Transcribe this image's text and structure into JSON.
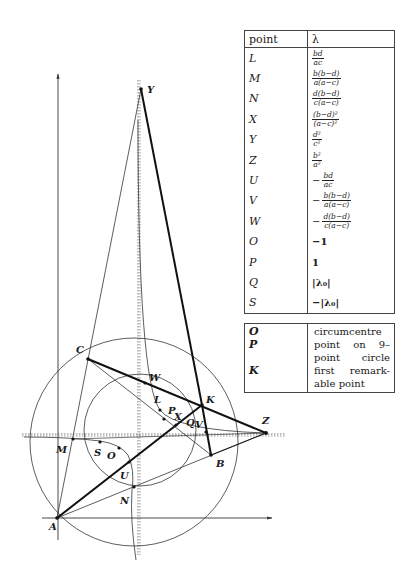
{
  "diagram": {
    "points": [
      {
        "name": "Y",
        "label": "Y"
      },
      {
        "name": "C",
        "label": "C"
      },
      {
        "name": "W",
        "label": "W"
      },
      {
        "name": "L",
        "label": "L"
      },
      {
        "name": "K",
        "label": "K"
      },
      {
        "name": "P",
        "label": "P"
      },
      {
        "name": "X",
        "label": "X"
      },
      {
        "name": "Q",
        "label": "Q"
      },
      {
        "name": "V",
        "label": "V"
      },
      {
        "name": "Z",
        "label": "Z"
      },
      {
        "name": "M",
        "label": "M"
      },
      {
        "name": "S",
        "label": "S"
      },
      {
        "name": "O",
        "label": "O"
      },
      {
        "name": "B",
        "label": "B"
      },
      {
        "name": "U",
        "label": "U"
      },
      {
        "name": "N",
        "label": "N"
      },
      {
        "name": "A",
        "label": "A"
      }
    ]
  },
  "table": {
    "header": {
      "col1": "point",
      "col2": "λ"
    },
    "rows": [
      {
        "point": "L",
        "sign": "",
        "num": "bd",
        "den": "ac"
      },
      {
        "point": "M",
        "sign": "",
        "num": "b(b−d)",
        "den": "a(a−c)"
      },
      {
        "point": "N",
        "sign": "",
        "num": "d(b−d)",
        "den": "c(a−c)"
      },
      {
        "point": "X",
        "sign": "",
        "num": "(b−d)²",
        "den": "(a−c)²"
      },
      {
        "point": "Y",
        "sign": "",
        "num": "d²",
        "den": "c²"
      },
      {
        "point": "Z",
        "sign": "",
        "num": "b²",
        "den": "a²"
      },
      {
        "point": "U",
        "sign": "−",
        "num": "bd",
        "den": "ac"
      },
      {
        "point": "V",
        "sign": "−",
        "num": "b(b−d)",
        "den": "a(a−c)"
      },
      {
        "point": "W",
        "sign": "−",
        "num": "d(b−d)",
        "den": "c(a−c)"
      },
      {
        "point": "O",
        "value": "−1"
      },
      {
        "point": "P",
        "value": "1"
      },
      {
        "point": "Q",
        "value": "|λ₀|"
      },
      {
        "point": "S",
        "value": "−|λ₀|"
      }
    ]
  },
  "legend": {
    "points": [
      "O",
      "P",
      "",
      "K"
    ],
    "text": "circumcentre point on 9–point circle first remark-able point"
  }
}
